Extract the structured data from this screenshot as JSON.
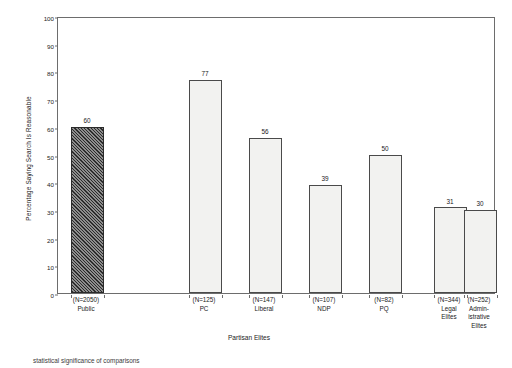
{
  "chart_data": {
    "type": "bar",
    "title": "",
    "xlabel": "Partisan Elites",
    "ylabel": "Percentage Saying Search Is Reasonable",
    "ylim": [
      0,
      100
    ],
    "yticks": [
      0,
      10,
      20,
      30,
      40,
      50,
      60,
      70,
      80,
      90,
      100
    ],
    "grid": false,
    "legend": "none",
    "categories": [
      "Public",
      "PC",
      "Liberal",
      "NDP",
      "PQ",
      "Legal Elites",
      "Administrative Elites"
    ],
    "values": [
      60,
      77,
      56,
      39,
      50,
      31,
      30
    ],
    "bars": [
      {
        "name": "Public",
        "label_line1": "(N=2050)",
        "label_line2": "Public",
        "value": 60,
        "n": 2050,
        "fill": "hatched"
      },
      {
        "name": "PC",
        "label_line1": "(N=125)",
        "label_line2": "PC",
        "value": 77,
        "n": 125,
        "fill": "plain"
      },
      {
        "name": "Liberal",
        "label_line1": "(N=147)",
        "label_line2": "Liberal",
        "value": 56,
        "n": 147,
        "fill": "plain"
      },
      {
        "name": "NDP",
        "label_line1": "(N=107)",
        "label_line2": "NDP",
        "value": 39,
        "n": 107,
        "fill": "plain"
      },
      {
        "name": "PQ",
        "label_line1": "(N=82)",
        "label_line2": "PQ",
        "value": 50,
        "n": 82,
        "fill": "plain"
      },
      {
        "name": "Legal Elites",
        "label_line1": "(N=344)",
        "label_line2": "Legal\nElites",
        "value": 31,
        "n": 344,
        "fill": "plain"
      },
      {
        "name": "Administrative Elites",
        "label_line1": "(N=252)",
        "label_line2": "Admin-\nistrative\nElites",
        "value": 30,
        "n": 252,
        "fill": "plain"
      }
    ],
    "colors": {
      "frame": "#6d6d6d",
      "bar_outline": "#4a4a4a",
      "bar_fill": "#f2f2f0",
      "hatch": "#2b2b2b",
      "text": "#1a1a1a",
      "background": "#ffffff"
    }
  },
  "footer": {
    "caption": "statistical significance of comparisons"
  }
}
